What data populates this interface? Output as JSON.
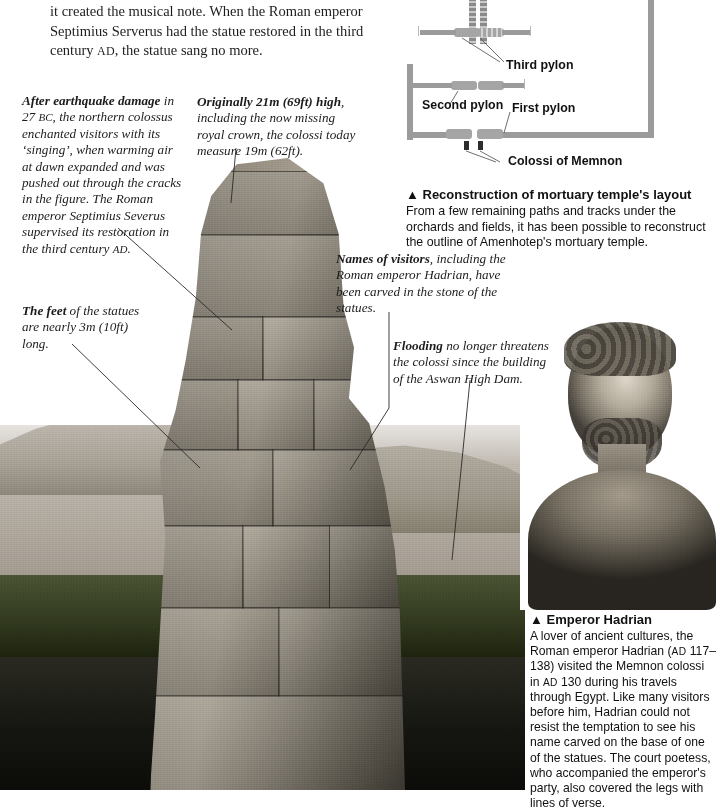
{
  "page": {
    "width": 720,
    "height": 803,
    "background": "#ffffff",
    "text_color": "#1a1a1a"
  },
  "body_text": {
    "lines": [
      "it created the musical note. When the Roman emperor",
      "Septimius Serverus had the statue restored in the third",
      "century AD, the statue sang no more."
    ],
    "line1": "it created the musical note. When the Roman emperor",
    "line2": "Septimius Serverus had the statue restored in the third",
    "line3_a": "century ",
    "line3_sc": "AD",
    "line3_b": ", the statue sang no more."
  },
  "annotations": [
    {
      "id": "earthquake",
      "lead_bold": "After earthquake damage",
      "text_a": " in 27 ",
      "small_caps_1": "BC",
      "text_b": ", the northern colossus enchanted visitors with its ‘singing’, when warming air at dawn expanded and was pushed out through the cracks in the figure. The Roman emperor Septimius Severus supervised its restoration in the third century ",
      "small_caps_2": "AD",
      "text_c": "."
    },
    {
      "id": "height",
      "lead_bold": "Originally 21m (69ft) high",
      "text_a": ", including the now missing royal crown, the colossi today measure 19m (62ft)."
    },
    {
      "id": "feet",
      "lead_bold": "The feet",
      "text_a": " of the statues are nearly 3m (10ft) long."
    },
    {
      "id": "names",
      "lead_bold": "Names of visitors",
      "text_a": ", including the Roman emperor Hadrian, have been carved in the stone of the statues."
    },
    {
      "id": "flooding",
      "lead_bold": "Flooding",
      "text_a": " no longer threatens the colossi since the building of the Aswan High Dam."
    }
  ],
  "diagram": {
    "labels": {
      "pillared_entrance": "pillared entrance",
      "third_pylon": "Third pylon",
      "second_pylon": "Second pylon",
      "first_pylon": "First pylon",
      "colossi_of_memnon": "Colossi of Memnon"
    },
    "colors": {
      "wall": "#9b9b9b",
      "pylon": "#a5a5a5",
      "colossi_block": "#2c2c2c"
    }
  },
  "captions": [
    {
      "id": "temple-layout",
      "marker": "▲",
      "title": "Reconstruction of mortuary temple's layout",
      "body": "From a few remaining paths and tracks under the orchards and fields, it has been possible to reconstruct the outline of Amenhotep's mortuary temple."
    },
    {
      "id": "emperor-hadrian",
      "marker": "▲",
      "title": "Emperor Hadrian",
      "body_1": "A lover of ancient cultures, the Roman emperor Hadrian (",
      "sc_1": "AD",
      "body_2": " 117–138) visited the Memnon colossi in ",
      "sc_2": "AD",
      "body_3": " 130 during his travels through Egypt. Like many visitors before him, Hadrian could not resist the temptation to see his name carved on the base of one of the statues. The court poetess, who accompanied the emperor's party, also covered the legs with lines of verse."
    }
  ],
  "images": {
    "colossus_photo": "colossus-of-memnon-photograph",
    "landscape_photo": "nile-valley-landscape-photograph",
    "hadrian_bust": "emperor-hadrian-bust-photograph"
  }
}
